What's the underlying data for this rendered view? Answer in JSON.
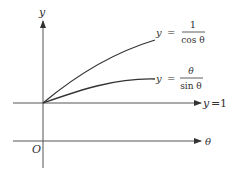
{
  "diagram": {
    "axes": {
      "vertical_label": "y",
      "horizontal_label": "θ",
      "origin_label": "O"
    },
    "reference_line": {
      "label": "y = 1",
      "label_lhs": "y",
      "label_eq": "=",
      "label_rhs": "1"
    },
    "curves": [
      {
        "name": "secant",
        "lhs": "y",
        "eq": "=",
        "numerator": "1",
        "denominator": "cos θ"
      },
      {
        "name": "theta-over-sine",
        "lhs": "y",
        "eq": "=",
        "numerator": "θ",
        "denominator": "sin θ"
      }
    ],
    "colors": {
      "ink": "#333333",
      "axis": "#555555"
    }
  }
}
